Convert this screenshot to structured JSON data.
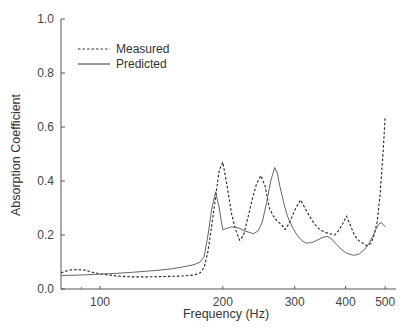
{
  "chart_data": {
    "type": "line",
    "title": "",
    "xlabel": "Frequency (Hz)",
    "ylabel": "Absorption Coefficient",
    "xscale": "log",
    "xlim": [
      80,
      520
    ],
    "ylim": [
      0.0,
      1.0
    ],
    "grid": false,
    "legend_position": "upper left",
    "x_ticks": [
      100,
      200,
      300,
      400,
      500
    ],
    "x_tick_labels": [
      "100",
      "200",
      "300",
      "400",
      "500"
    ],
    "y_ticks": [
      0.0,
      0.2,
      0.4,
      0.6,
      0.8,
      1.0
    ],
    "y_tick_labels": [
      "0.0",
      "0.2",
      "0.4",
      "0.6",
      "0.8",
      "1.0"
    ],
    "series": [
      {
        "name": "Measured",
        "style": "dashed",
        "x": [
          80,
          84,
          88,
          92,
          96,
          100,
          110,
          120,
          130,
          140,
          150,
          160,
          170,
          176,
          180,
          184,
          188,
          192,
          196,
          200,
          205,
          210,
          215,
          220,
          225,
          230,
          236,
          242,
          248,
          254,
          260,
          266,
          272,
          278,
          284,
          290,
          296,
          302,
          310,
          318,
          326,
          336,
          346,
          356,
          366,
          376,
          386,
          396,
          402,
          410,
          420,
          430,
          440,
          452,
          462,
          470,
          478,
          486,
          494,
          500
        ],
        "y": [
          0.06,
          0.07,
          0.072,
          0.07,
          0.062,
          0.056,
          0.048,
          0.045,
          0.045,
          0.046,
          0.047,
          0.048,
          0.052,
          0.06,
          0.08,
          0.14,
          0.24,
          0.34,
          0.44,
          0.47,
          0.38,
          0.28,
          0.22,
          0.18,
          0.2,
          0.26,
          0.33,
          0.39,
          0.42,
          0.38,
          0.3,
          0.27,
          0.25,
          0.24,
          0.22,
          0.24,
          0.27,
          0.3,
          0.33,
          0.3,
          0.27,
          0.24,
          0.22,
          0.21,
          0.205,
          0.2,
          0.22,
          0.25,
          0.27,
          0.24,
          0.2,
          0.18,
          0.17,
          0.16,
          0.17,
          0.2,
          0.25,
          0.35,
          0.5,
          0.64
        ]
      },
      {
        "name": "Predicted",
        "style": "solid",
        "x": [
          80,
          90,
          100,
          110,
          120,
          130,
          140,
          150,
          160,
          170,
          176,
          180,
          184,
          188,
          192,
          196,
          200,
          205,
          210,
          215,
          220,
          226,
          232,
          238,
          244,
          250,
          256,
          262,
          268,
          272,
          276,
          282,
          288,
          296,
          304,
          312,
          320,
          330,
          340,
          350,
          360,
          370,
          380,
          390,
          400,
          410,
          420,
          432,
          444,
          456,
          466,
          474,
          482,
          490,
          500
        ],
        "y": [
          0.05,
          0.052,
          0.055,
          0.058,
          0.062,
          0.066,
          0.07,
          0.075,
          0.082,
          0.09,
          0.1,
          0.12,
          0.2,
          0.3,
          0.36,
          0.3,
          0.22,
          0.225,
          0.23,
          0.228,
          0.225,
          0.215,
          0.21,
          0.205,
          0.215,
          0.25,
          0.32,
          0.4,
          0.45,
          0.43,
          0.38,
          0.32,
          0.27,
          0.23,
          0.2,
          0.18,
          0.17,
          0.172,
          0.18,
          0.19,
          0.195,
          0.185,
          0.165,
          0.148,
          0.135,
          0.128,
          0.125,
          0.13,
          0.145,
          0.168,
          0.195,
          0.22,
          0.24,
          0.245,
          0.23
        ]
      }
    ]
  },
  "legend": {
    "measured_label": "Measured",
    "predicted_label": "Predicted"
  },
  "axes": {
    "xlabel": "Frequency (Hz)",
    "ylabel": "Absorption Coefficient"
  }
}
